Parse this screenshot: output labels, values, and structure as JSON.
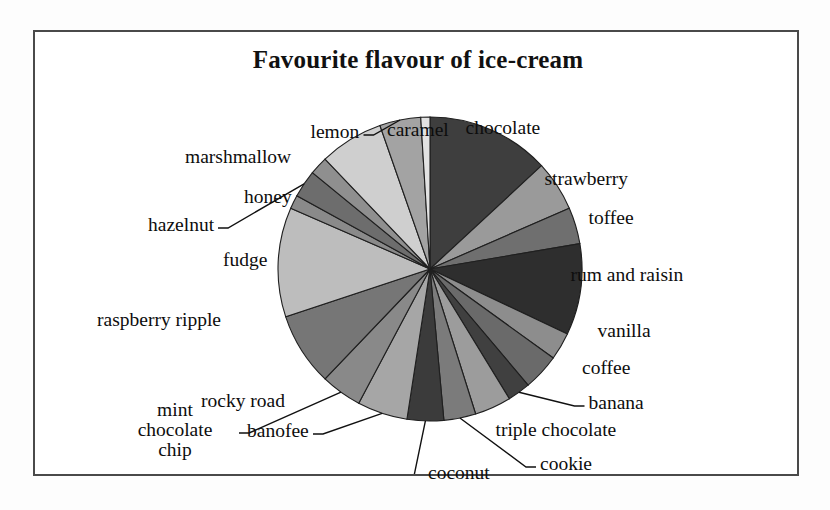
{
  "chart_data": {
    "type": "pie",
    "title": "Favourite flavour of ice-cream",
    "xlabel": "",
    "ylabel": "",
    "legend_position": "none",
    "grid": false,
    "start_angle_deg": 0,
    "direction": "clockwise",
    "categories": [
      "chocolate",
      "strawberry",
      "toffee",
      "rum and raisin",
      "vanilla",
      "coffee",
      "banana",
      "triple chocolate",
      "cookie",
      "coconut",
      "banofee",
      "mint chocolate chip",
      "rocky road",
      "raspberry ripple",
      "fudge",
      "hazelnut",
      "honey",
      "marshmallow",
      "lemon",
      "caramel"
    ],
    "values": [
      13.5,
      5.5,
      4.0,
      10.0,
      3.0,
      4.0,
      2.5,
      4.0,
      3.5,
      4.0,
      5.5,
      4.5,
      8.0,
      12.0,
      1.5,
      3.0,
      2.0,
      7.0,
      4.5,
      1.0
    ],
    "colors": [
      "#3e3e3e",
      "#9a9a9a",
      "#6f6f6f",
      "#2e2e2e",
      "#8d8d8d",
      "#6a6a6a",
      "#404040",
      "#9c9c9c",
      "#7b7b7b",
      "#3b3b3b",
      "#a6a6a6",
      "#898989",
      "#767676",
      "#bdbdbd",
      "#8a8a8a",
      "#6d6d6d",
      "#8f8f8f",
      "#cfcfcf",
      "#a3a3a3",
      "#e2e2e2"
    ]
  },
  "labels": [
    {
      "text": "chocolate",
      "x": 468,
      "y": 96,
      "leader": false
    },
    {
      "text": "strawberry",
      "x": 551,
      "y": 147,
      "leader": false
    },
    {
      "text": "toffee",
      "x": 576,
      "y": 186,
      "leader": false
    },
    {
      "text": "rum and raisin",
      "x": 592,
      "y": 243,
      "leader": false
    },
    {
      "text": "vanilla",
      "x": 589,
      "y": 299,
      "leader": false
    },
    {
      "text": "coffee",
      "x": 571,
      "y": 336,
      "leader": false
    },
    {
      "text": "banana",
      "x": 581,
      "y": 371,
      "leader": true
    },
    {
      "text": "triple chocolate",
      "x": 521,
      "y": 398,
      "leader": false
    },
    {
      "text": "cookie",
      "x": 531,
      "y": 432,
      "leader": true
    },
    {
      "text": "coconut",
      "x": 424,
      "y": 441,
      "leader": true
    },
    {
      "text": "banofee",
      "x": 243,
      "y": 399,
      "leader": true
    },
    {
      "text": "mint chocolate chip",
      "x": 140,
      "y": 398,
      "leader": true
    },
    {
      "text": "rocky road",
      "x": 208,
      "y": 369,
      "leader": false
    },
    {
      "text": "raspberry ripple",
      "x": 124,
      "y": 288,
      "leader": false
    },
    {
      "text": "fudge",
      "x": 210,
      "y": 228,
      "leader": false
    },
    {
      "text": "hazelnut",
      "x": 146,
      "y": 193,
      "leader": true
    },
    {
      "text": "honey",
      "x": 233,
      "y": 165,
      "leader": false
    },
    {
      "text": "marshmallow",
      "x": 203,
      "y": 125,
      "leader": false
    },
    {
      "text": "lemon",
      "x": 300,
      "y": 100,
      "leader": true
    },
    {
      "text": "caramel",
      "x": 383,
      "y": 98,
      "leader": false
    }
  ]
}
